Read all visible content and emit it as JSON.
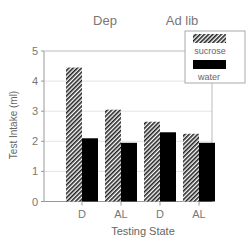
{
  "chart_data": {
    "type": "bar",
    "title": "",
    "group_labels": [
      "Dep",
      "Ad lib"
    ],
    "categories": [
      "D",
      "AL",
      "D",
      "AL"
    ],
    "series": [
      {
        "name": "sucrose",
        "values": [
          4.45,
          3.05,
          2.65,
          2.25
        ],
        "fill": "hatched"
      },
      {
        "name": "water",
        "values": [
          2.1,
          1.95,
          2.3,
          1.95
        ],
        "fill": "#000000"
      }
    ],
    "xlabel": "Testing State",
    "ylabel": "Test Intake (ml)",
    "ylim": [
      0,
      5
    ],
    "yticks": [
      0,
      1,
      2,
      3,
      4,
      5
    ],
    "grid": true,
    "legend_position": "top-right"
  },
  "labels": {
    "group_dep": "Dep",
    "group_adlib": "Ad lib",
    "xlabel": "Testing State",
    "ylabel": "Test Intake (ml)",
    "legend_sucrose": "sucrose",
    "legend_water": "water",
    "yticks": [
      "0",
      "1",
      "2",
      "3",
      "4",
      "5"
    ],
    "xticks": [
      "D",
      "AL",
      "D",
      "AL"
    ]
  }
}
